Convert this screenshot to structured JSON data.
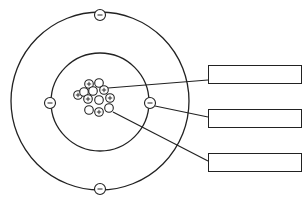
{
  "diagram": {
    "type": "atom-model",
    "colors": {
      "stroke": "#222222",
      "background": "#ffffff"
    },
    "shells": [
      {
        "name": "outer-shell",
        "cx": 100,
        "cy": 101,
        "r": 89
      },
      {
        "name": "inner-shell",
        "cx": 100,
        "cy": 102,
        "r": 49
      }
    ],
    "electrons": [
      {
        "x": 100,
        "y": 15,
        "symbol": "−"
      },
      {
        "x": 100,
        "y": 189,
        "symbol": "−"
      },
      {
        "x": 50,
        "y": 103,
        "symbol": "−"
      },
      {
        "x": 150,
        "y": 103,
        "symbol": "−"
      }
    ],
    "nucleus": [
      {
        "x": 89,
        "y": 84,
        "symbol": "+"
      },
      {
        "x": 99,
        "y": 83,
        "symbol": ""
      },
      {
        "x": 93,
        "y": 91,
        "symbol": ""
      },
      {
        "x": 104,
        "y": 90,
        "symbol": "+"
      },
      {
        "x": 78,
        "y": 95,
        "symbol": "+"
      },
      {
        "x": 84,
        "y": 92,
        "symbol": ""
      },
      {
        "x": 88,
        "y": 99,
        "symbol": "+"
      },
      {
        "x": 99,
        "y": 100,
        "symbol": ""
      },
      {
        "x": 110,
        "y": 98,
        "symbol": "+"
      },
      {
        "x": 89,
        "y": 110,
        "symbol": ""
      },
      {
        "x": 99,
        "y": 112,
        "symbol": "+"
      },
      {
        "x": 109,
        "y": 108,
        "symbol": ""
      }
    ],
    "leader_lines": [
      {
        "x1": 108,
        "y1": 88,
        "x2": 208,
        "y2": 80
      },
      {
        "x1": 155,
        "y1": 106,
        "x2": 208,
        "y2": 117
      },
      {
        "x1": 113,
        "y1": 112,
        "x2": 208,
        "y2": 161
      }
    ],
    "label_boxes": [
      {
        "top": 65,
        "text": ""
      },
      {
        "top": 109,
        "text": ""
      },
      {
        "top": 153,
        "text": ""
      }
    ]
  }
}
